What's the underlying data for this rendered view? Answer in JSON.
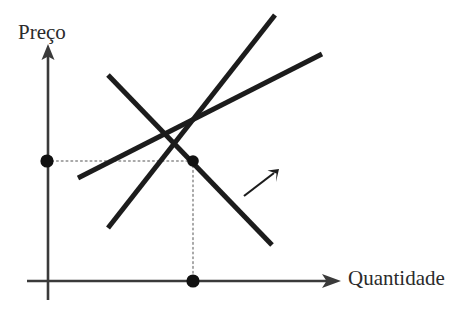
{
  "figure": {
    "title": "",
    "kind": "supply-and-demand-diagram",
    "background_color": "#ffffff",
    "line_color": "#1c1c1c",
    "axis_color": "#3a3a3a",
    "dashed_color": "#8c8c8c",
    "text_color": "#2b2b2b"
  },
  "axes": {
    "y_label": "Preço",
    "x_label": "Quantidade",
    "y_axis": {
      "x": 48,
      "y_top": 48,
      "y_bottom": 300,
      "arrow": "up"
    },
    "x_axis": {
      "y": 281,
      "x_left": 27,
      "x_right": 340,
      "arrow": "right"
    }
  },
  "chart_data": {
    "type": "line",
    "title": "",
    "xlabel": "Quantidade",
    "ylabel": "Preço",
    "grid": false,
    "legend": "none",
    "axis_ranges": {
      "x": [
        27,
        340
      ],
      "y": [
        48,
        300
      ]
    },
    "series": [
      {
        "name": "supply-curve-1",
        "role": "oferta-inicial",
        "slope": "positive",
        "x": [
          108,
          275
        ],
        "y": [
          228,
          15
        ]
      },
      {
        "name": "supply-curve-2",
        "role": "oferta-deslocada",
        "slope": "positive",
        "x": [
          78,
          322
        ],
        "y": [
          178,
          54
        ]
      },
      {
        "name": "demand-curve",
        "role": "demanda",
        "slope": "negative",
        "x": [
          108,
          272
        ],
        "y": [
          75,
          245
        ]
      }
    ],
    "points": [
      {
        "name": "equilibrium-point",
        "x": 193,
        "y": 161,
        "marker": "filled-circle"
      },
      {
        "name": "price-axis-point",
        "x": 47,
        "y": 161,
        "marker": "filled-circle"
      },
      {
        "name": "quantity-axis-point",
        "x": 193,
        "y": 281,
        "marker": "filled-circle"
      }
    ],
    "guide_lines": [
      {
        "name": "price-guide-line",
        "orientation": "horizontal",
        "from": [
          47,
          161
        ],
        "to": [
          193,
          161
        ],
        "style": "dotted"
      },
      {
        "name": "quantity-guide-line",
        "orientation": "vertical",
        "from": [
          193,
          161
        ],
        "to": [
          193,
          281
        ],
        "style": "dotted"
      }
    ],
    "annotations": [
      {
        "name": "shift-arrow",
        "from": [
          244,
          196
        ],
        "to": [
          279,
          169
        ],
        "direction": "up-right",
        "text": ""
      }
    ]
  }
}
